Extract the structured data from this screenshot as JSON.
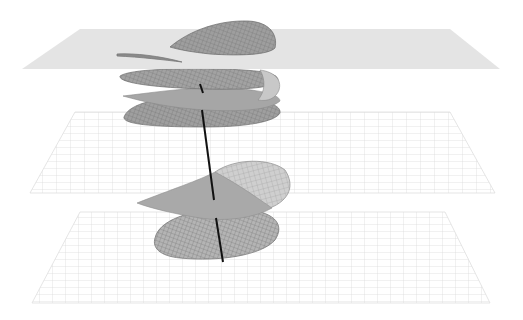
{
  "figure": {
    "width": 523,
    "height": 320
  },
  "colors": {
    "background": "#ffffff",
    "top_plane": "#e4e4e4",
    "grid_plane_line": "#d4d4d4",
    "surface_fill": "#a8a8a8",
    "surface_dark": "#8c8c8c",
    "mesh_line": "#6e6e6e",
    "axis": "#111111"
  },
  "planes": [
    {
      "name": "top-plane",
      "style": "solid",
      "points": "80,29 450,29 500,69 22,69"
    },
    {
      "name": "middle-plane",
      "style": "grid",
      "points": "75,112 450,112 495,193 30,193"
    },
    {
      "name": "bottom-plane",
      "style": "grid",
      "points": "80,212 445,212 490,303 32,303"
    }
  ],
  "axis": {
    "x1": 200,
    "y1": 80,
    "x2": 223,
    "y2": 262
  }
}
